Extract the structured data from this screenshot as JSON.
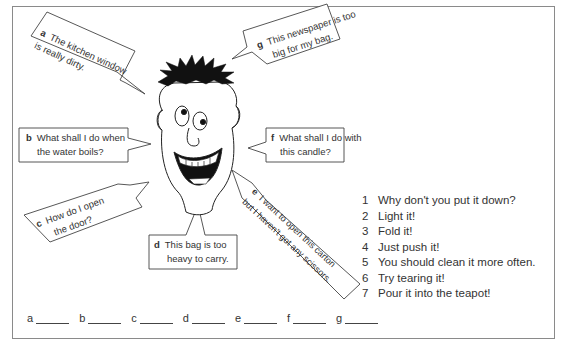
{
  "bubbles": {
    "a": {
      "letter": "a",
      "line1": "The kitchen window",
      "line2": "is really dirty."
    },
    "b": {
      "letter": "b",
      "line1": "What shall I do when",
      "line2": "the water boils?"
    },
    "c": {
      "letter": "c",
      "line1": "How do I open",
      "line2": "the door?"
    },
    "d": {
      "letter": "d",
      "line1": "This bag is too",
      "line2": "heavy to carry."
    },
    "e": {
      "letter": "e",
      "line1": "I want to open this carton",
      "line2": "but I haven't got any scissors."
    },
    "f": {
      "letter": "f",
      "line1": "What shall I do with",
      "line2": "this candle?"
    },
    "g": {
      "letter": "g",
      "line1": "This newspaper is too",
      "line2": "big for my bag."
    }
  },
  "responses": [
    {
      "num": "1",
      "text": "Why don't you put it down?"
    },
    {
      "num": "2",
      "text": "Light it!"
    },
    {
      "num": "3",
      "text": "Fold it!"
    },
    {
      "num": "4",
      "text": "Just push it!"
    },
    {
      "num": "5",
      "text": "You should clean it more often."
    },
    {
      "num": "6",
      "text": "Try tearing it!"
    },
    {
      "num": "7",
      "text": "Pour it into the teapot!"
    }
  ],
  "answer_blanks": [
    {
      "letter": "a"
    },
    {
      "letter": "b"
    },
    {
      "letter": "c"
    },
    {
      "letter": "d"
    },
    {
      "letter": "e"
    },
    {
      "letter": "f"
    },
    {
      "letter": "g"
    }
  ]
}
